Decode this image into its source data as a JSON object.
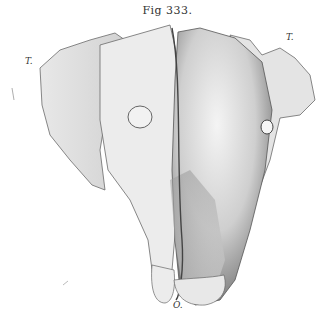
{
  "figure": {
    "caption": "Fig 333.",
    "labels": {
      "top_left": "T.",
      "top_right": "T.",
      "bottom": "O."
    },
    "colors": {
      "background": "#ffffff",
      "ink": "#3a3a3a",
      "shade_dark": "#7a7a7a",
      "shade_mid": "#b8b8b8",
      "shade_light": "#e6e6e6"
    }
  }
}
